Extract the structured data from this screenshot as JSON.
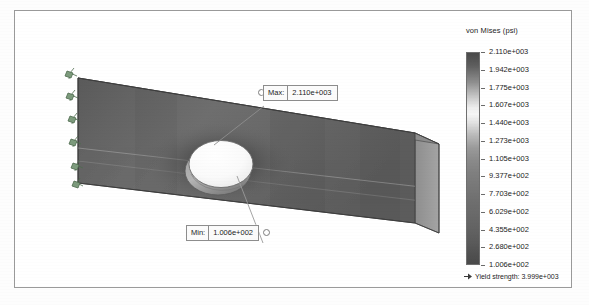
{
  "study": {
    "legend_title": "von Mises (psi)",
    "yield_label": "Yield strength: 3.999e+003",
    "yield_marker_icon": "yield-arrow-icon"
  },
  "annotations": {
    "max": {
      "tag": "Max:",
      "value": "2.110e+003"
    },
    "min": {
      "tag": "Min:",
      "value": "1.006e+002"
    }
  },
  "chart_data": {
    "type": "heatmap",
    "title": "von Mises (psi)",
    "colorbar_labels": [
      "2.110e+003",
      "1.942e+003",
      "1.775e+003",
      "1.607e+003",
      "1.440e+003",
      "1.273e+003",
      "1.105e+003",
      "9.377e+002",
      "7.703e+002",
      "6.029e+002",
      "4.355e+002",
      "2.680e+002",
      "1.006e+002"
    ],
    "colorbar_values": [
      2110,
      1942,
      1775,
      1607,
      1440,
      1273,
      1105,
      937.7,
      770.3,
      602.9,
      435.5,
      268.0,
      100.6
    ],
    "units": "psi",
    "min": 100.6,
    "max": 2110,
    "yield_strength": 3999,
    "annotations": [
      {
        "label": "Max:",
        "value": 2110,
        "text": "2.110e+003"
      },
      {
        "label": "Min:",
        "value": 100.6,
        "text": "1.006e+002"
      }
    ],
    "legend_position": "right",
    "grid": false
  },
  "model": {
    "part_name": "tapered-plate-with-hole",
    "fixture_icon": "fixture-restraint-icon",
    "fixture_count": 5
  }
}
